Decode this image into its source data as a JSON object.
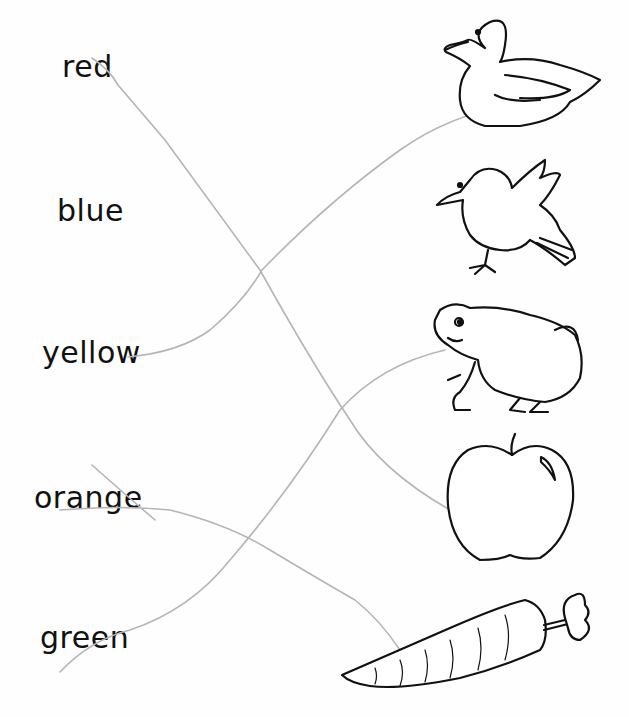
{
  "worksheet": {
    "words": [
      {
        "id": "red",
        "label": "red",
        "x": 62,
        "y": 55
      },
      {
        "id": "blue",
        "label": "blue",
        "x": 58,
        "y": 196
      },
      {
        "id": "yellow",
        "label": "yellow",
        "x": 42,
        "y": 340
      },
      {
        "id": "orange",
        "label": "orange",
        "x": 34,
        "y": 486
      },
      {
        "id": "green",
        "label": "green",
        "x": 40,
        "y": 625
      }
    ],
    "pictures": [
      {
        "id": "duck",
        "label": "duck"
      },
      {
        "id": "bird",
        "label": "bird"
      },
      {
        "id": "frog",
        "label": "frog"
      },
      {
        "id": "apple",
        "label": "apple"
      },
      {
        "id": "carrot",
        "label": "carrot"
      }
    ],
    "matches": [
      {
        "word": "red",
        "picture": "apple"
      },
      {
        "word": "yellow",
        "picture": "duck"
      },
      {
        "word": "orange",
        "picture": "carrot"
      },
      {
        "word": "green",
        "picture": "frog"
      }
    ],
    "line_color": "#b5b5b5",
    "ink_color": "#111111"
  }
}
